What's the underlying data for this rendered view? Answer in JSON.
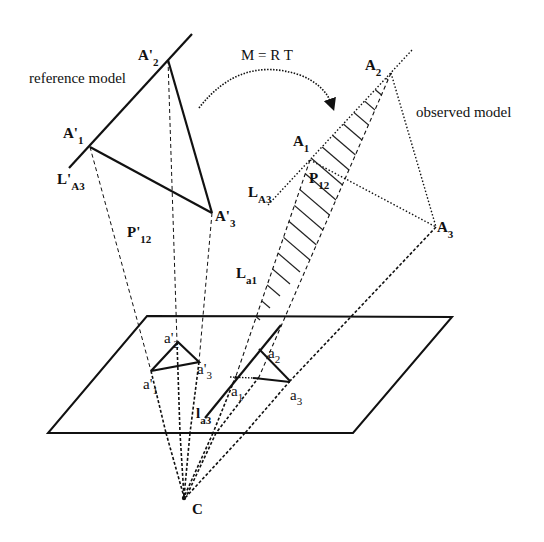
{
  "diagram": {
    "transform_label": "M = R T",
    "reference_label": "reference model",
    "observed_label": "observed model",
    "reference_points": {
      "A1": {
        "base": "A'",
        "sub": "1"
      },
      "A2": {
        "base": "A'",
        "sub": "2"
      },
      "A3": {
        "base": "A'",
        "sub": "3"
      },
      "line": {
        "base": "L'",
        "sub": "A3"
      },
      "plane": {
        "base": "P'",
        "sub": "12"
      }
    },
    "observed_points": {
      "A1": {
        "base": "A",
        "sub": "1"
      },
      "A2": {
        "base": "A",
        "sub": "2"
      },
      "A3": {
        "base": "A",
        "sub": "3"
      },
      "line": {
        "base": "L",
        "sub": "A3"
      },
      "plane": {
        "base": "P",
        "sub": "12"
      },
      "ray": {
        "base": "L",
        "sub": "a1"
      }
    },
    "image_points_reference": {
      "a1": {
        "base": "a'",
        "sub": "1"
      },
      "a2": {
        "base": "a'",
        "sub": "2"
      },
      "a3": {
        "base": "a'",
        "sub": "3"
      }
    },
    "image_points_observed": {
      "a1": {
        "base": "a",
        "sub": "1"
      },
      "a2": {
        "base": "a",
        "sub": "2"
      },
      "a3": {
        "base": "a",
        "sub": "3"
      },
      "line": {
        "base": "l",
        "sub": "a3"
      }
    },
    "camera_center": "C",
    "colors": {
      "stroke": "#111111",
      "background": "#ffffff"
    }
  }
}
